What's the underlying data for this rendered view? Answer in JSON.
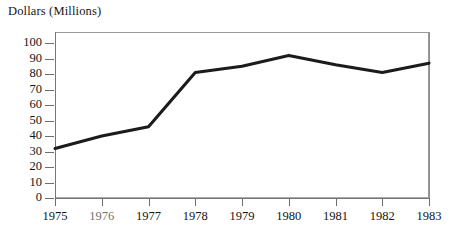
{
  "chart_data": {
    "type": "line",
    "title": "",
    "ylabel": "Dollars (Millions)",
    "xlabel": "",
    "categories": [
      "1975",
      "1976",
      "1977",
      "1978",
      "1979",
      "1980",
      "1981",
      "1982",
      "1983"
    ],
    "values": [
      32,
      40,
      46,
      81,
      85,
      92,
      86,
      81,
      87
    ],
    "series": [
      {
        "name": "Dollars (Millions)",
        "values": [
          32,
          40,
          46,
          81,
          85,
          92,
          86,
          81,
          87
        ]
      }
    ],
    "ylim": [
      0,
      100
    ],
    "ytick_labels": [
      "100",
      "90",
      "80",
      "70",
      "60",
      "50",
      "40",
      "30",
      "20",
      "10",
      "0"
    ],
    "ytick_values": [
      100,
      90,
      80,
      70,
      60,
      50,
      40,
      30,
      20,
      10,
      0
    ],
    "xtick_labels": [
      "1975",
      "1976",
      "1977",
      "1978",
      "1979",
      "1980",
      "1981",
      "1982",
      "1983"
    ],
    "grid": false,
    "legend": false,
    "legend_position": "none",
    "line_color": "#1b1b1b",
    "frame_color": "#9a9a9a",
    "background_color": "#ffffff"
  },
  "axis": {
    "y_title": "Dollars (Millions)"
  }
}
